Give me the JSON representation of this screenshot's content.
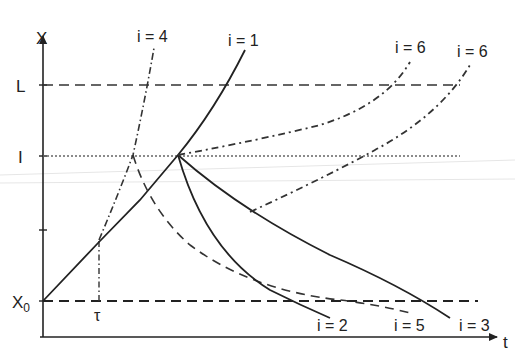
{
  "diagram": {
    "axes": {
      "y_label": "X",
      "x_label": "t",
      "y_ticks": [
        {
          "label": "L",
          "y": 85
        },
        {
          "label": "I",
          "y": 156
        },
        {
          "label": "",
          "y": 230
        },
        {
          "label": "X0",
          "y": 301
        }
      ],
      "x_marker": {
        "label": "τ",
        "x": 99
      }
    },
    "reference_lines": [
      {
        "name": "L",
        "style": "dashed"
      },
      {
        "name": "I",
        "style": "dotted"
      },
      {
        "name": "X0",
        "style": "dashed"
      }
    ],
    "curve_labels": {
      "i4": "i = 4",
      "i1": "i = 1",
      "i6a": "i = 6",
      "i6b": "i = 6",
      "i2": "i = 2",
      "i5": "i = 5",
      "i3": "i = 3"
    },
    "colors": {
      "ink": "#222222",
      "background": "#ffffff"
    }
  }
}
